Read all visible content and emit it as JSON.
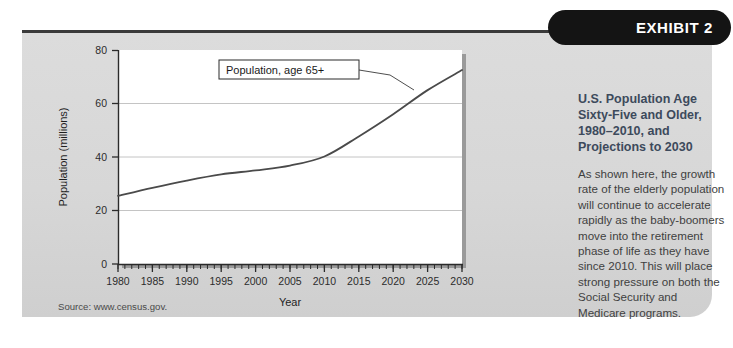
{
  "badge": {
    "label": "EXHIBIT 2"
  },
  "panel": {
    "title": "U.S. Population Age Sixty-Five and Older, 1980–2010, and Projections to 2030",
    "body": "As shown here, the growth rate of the elderly population will continue to accelerate rapidly as the baby-boomers move into the retirement phase of life as they have since 2010. This will place strong pressure on both the Social Security and Medicare programs."
  },
  "source": {
    "text": "Source: www.census.gov."
  },
  "chart_data": {
    "type": "line",
    "title": "",
    "xlabel": "Year",
    "ylabel": "Population (millions)",
    "xlim": [
      1980,
      2030
    ],
    "ylim": [
      0,
      80
    ],
    "yticks": [
      0,
      20,
      40,
      60,
      80
    ],
    "xticks": [
      1980,
      1985,
      1990,
      1995,
      2000,
      2005,
      2010,
      2015,
      2020,
      2025,
      2030
    ],
    "minor_tick_step": 1,
    "grid": "horizontal",
    "legend": "none",
    "annotation": {
      "text": "Population, age 65+",
      "points_to_year": 2027
    },
    "series": [
      {
        "name": "Population, age 65+",
        "x": [
          1980,
          1985,
          1990,
          1995,
          2000,
          2005,
          2010,
          2015,
          2020,
          2025,
          2030
        ],
        "values": [
          25.5,
          28.5,
          31.2,
          33.5,
          35.0,
          36.8,
          40.2,
          47.7,
          56.0,
          65.0,
          72.5
        ]
      }
    ]
  }
}
